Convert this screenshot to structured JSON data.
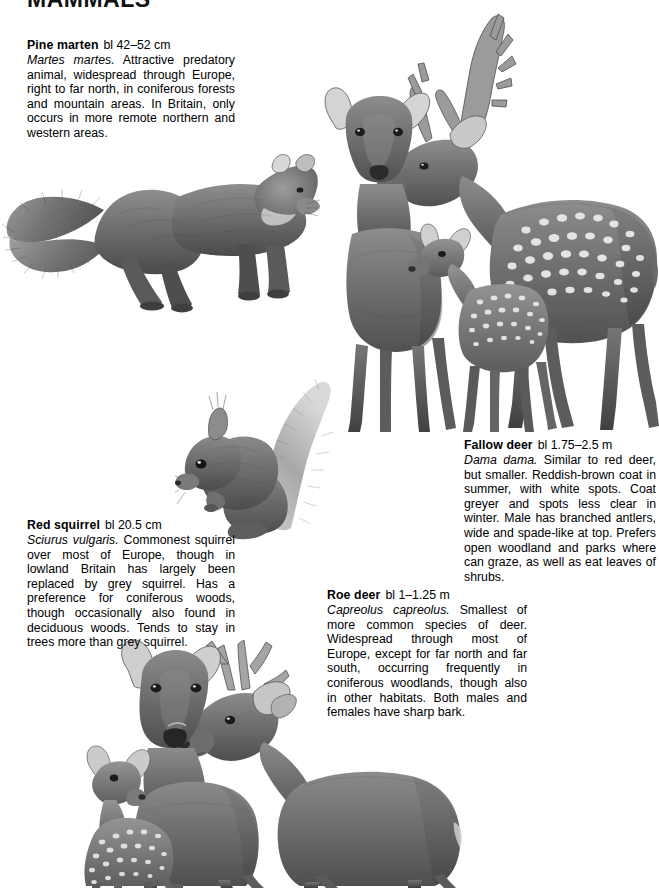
{
  "page": {
    "running_head": "MAMMALS",
    "background_color": "#ffffff",
    "text_color": "#000000"
  },
  "entries": [
    {
      "id": "pine-marten",
      "common_name": "Pine marten",
      "measurement": "bl 42–52 cm",
      "scientific_name": "Martes martes.",
      "description": " Attractive predatory animal, widespread through Europe, right to far north, in coniferous forests and mountain areas. In Britain, only occurs in more remote northern and western areas."
    },
    {
      "id": "red-squirrel",
      "common_name": "Red squirrel",
      "measurement": "bl 20.5 cm",
      "scientific_name": "Sciurus vulgaris.",
      "description": " Commonest squirrel over most of Europe, though in lowland Britain has largely been replaced by grey squirrel. Has a preference for coniferous woods, though occasionally also found in deciduous woods. Tends to stay in trees more than grey squirrel."
    },
    {
      "id": "fallow-deer",
      "common_name": "Fallow deer",
      "measurement": "bl 1.75–2.5 m",
      "scientific_name": "Dama dama.",
      "description": " Similar to red deer, but smaller. Reddish-brown coat in summer, with white spots. Coat greyer and spots less clear in winter. Male has branched antlers, wide and spade-like at top. Prefers open woodland and parks where can graze, as well as eat leaves of shrubs."
    },
    {
      "id": "roe-deer",
      "common_name": "Roe deer",
      "measurement": "bl 1–1.25 m",
      "scientific_name": "Capreolus capreolus.",
      "description": " Smallest of more common species of deer. Widespread through most of Europe, except for far north and far south, occurring frequently in coniferous woodlands, though also in other habitats. Both males and females have sharp bark."
    }
  ],
  "illustrations": [
    {
      "id": "pine-marten-illustration",
      "subject": "Pine marten, side view, bushy tail"
    },
    {
      "id": "fallow-deer-illustration",
      "subject": "Fallow deer group: doe, fawn and spotted buck with palmate antlers"
    },
    {
      "id": "red-squirrel-illustration",
      "subject": "Red squirrel seated with raised bushy tail and ear tufts"
    },
    {
      "id": "roe-deer-illustration",
      "subject": "Roe deer group: doe, spotted fawn and buck with short antlers"
    }
  ]
}
